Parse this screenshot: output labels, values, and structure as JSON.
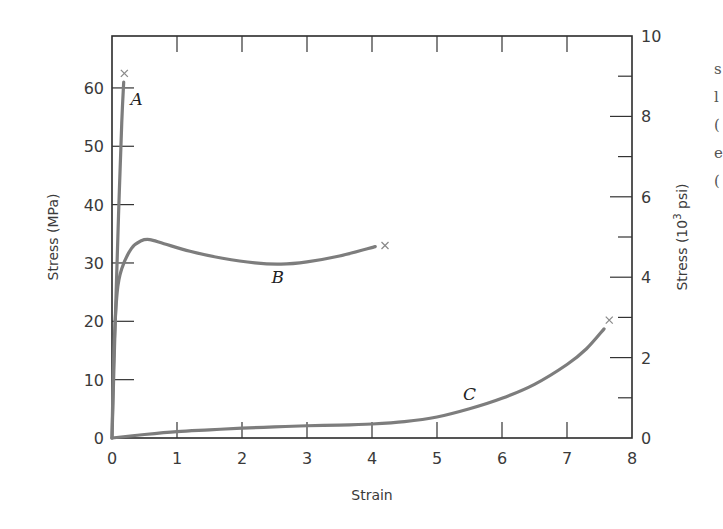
{
  "chart_data": {
    "type": "line",
    "title": "",
    "xlabel": "Strain",
    "ylabel": "Stress (MPa)",
    "ylabel_right": "Stress (10^3 psi)",
    "xlim": [
      0,
      8
    ],
    "ylim": [
      0,
      68.9
    ],
    "ylim_right": [
      0,
      10
    ],
    "grid": false,
    "legend": "none (curves labeled inline)",
    "x_ticks": [
      0,
      1,
      2,
      3,
      4,
      5,
      6,
      7,
      8
    ],
    "y_ticks": [
      0,
      10,
      20,
      30,
      40,
      50,
      60
    ],
    "y_ticks_right": [
      0,
      2,
      4,
      6,
      8,
      10
    ],
    "series": [
      {
        "name": "A",
        "description": "brittle polymer",
        "x": [
          0,
          0.05,
          0.1,
          0.15,
          0.18
        ],
        "y": [
          0,
          20,
          38,
          54,
          61
        ],
        "fracture": {
          "x": 0.19,
          "y": 62.5
        }
      },
      {
        "name": "B",
        "description": "plastic polymer",
        "x": [
          0,
          0.03,
          0.08,
          0.15,
          0.3,
          0.45,
          0.58,
          0.8,
          1.2,
          1.7,
          2.2,
          2.6,
          3.0,
          3.5,
          4.05
        ],
        "y": [
          0,
          15,
          25,
          29,
          32.5,
          33.8,
          34.0,
          33.3,
          32.0,
          30.8,
          30.0,
          29.8,
          30.2,
          31.2,
          32.8
        ],
        "fracture": {
          "x": 4.2,
          "y": 33.0
        }
      },
      {
        "name": "C",
        "description": "highly elastic (elastomer)",
        "x": [
          0,
          0.5,
          1,
          1.5,
          2,
          2.5,
          3,
          3.5,
          4,
          4.5,
          5,
          5.5,
          6,
          6.5,
          7,
          7.3,
          7.57
        ],
        "y": [
          0,
          0.6,
          1.1,
          1.4,
          1.7,
          1.9,
          2.1,
          2.2,
          2.4,
          2.8,
          3.6,
          5.0,
          6.8,
          9.2,
          12.6,
          15.3,
          18.7
        ],
        "fracture": {
          "x": 7.65,
          "y": 20.2
        }
      }
    ],
    "annotations": [
      {
        "text": "A",
        "x": 0.38,
        "y": 57
      },
      {
        "text": "B",
        "x": 2.55,
        "y": 26.5
      },
      {
        "text": "C",
        "x": 5.5,
        "y": 6.5
      }
    ]
  },
  "page_fragments": [
    "s",
    "l",
    "(",
    "e",
    "("
  ]
}
